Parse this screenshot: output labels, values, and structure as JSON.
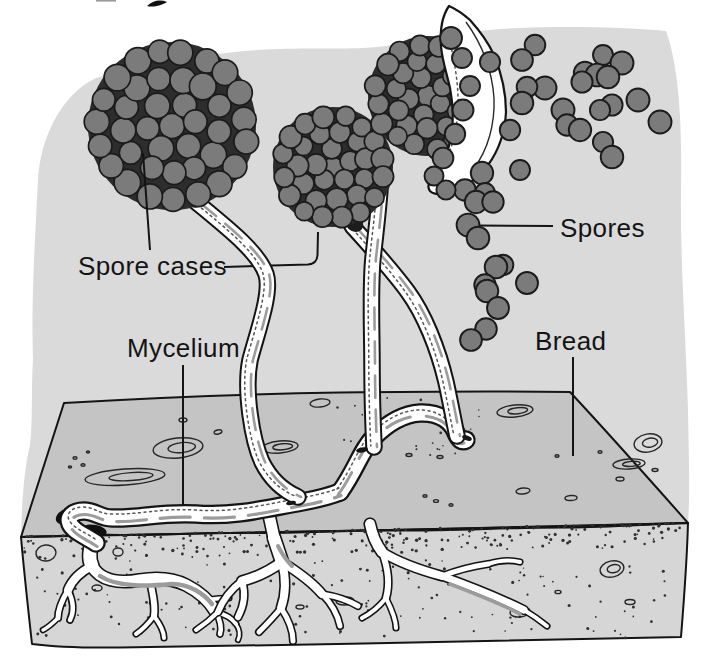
{
  "figure": {
    "type": "labeled-diagram",
    "labels": {
      "spore_cases": "Spore cases",
      "spores": "Spores",
      "mycelium": "Mycelium",
      "bread": "Bread"
    },
    "spore_case_count": "3",
    "colors": {
      "page_bg": "#ffffff",
      "air_wash": "#dadada",
      "bread_top": "#c4c4c4",
      "bread_front": "#d6d6d6",
      "spore_fill": "#7b7b7b",
      "spore_stroke": "#1b1b1b",
      "cluster_shadow": "#2d2d2d",
      "ink": "#141414",
      "white": "#ffffff",
      "shade_gray": "#9c9c9c"
    }
  }
}
